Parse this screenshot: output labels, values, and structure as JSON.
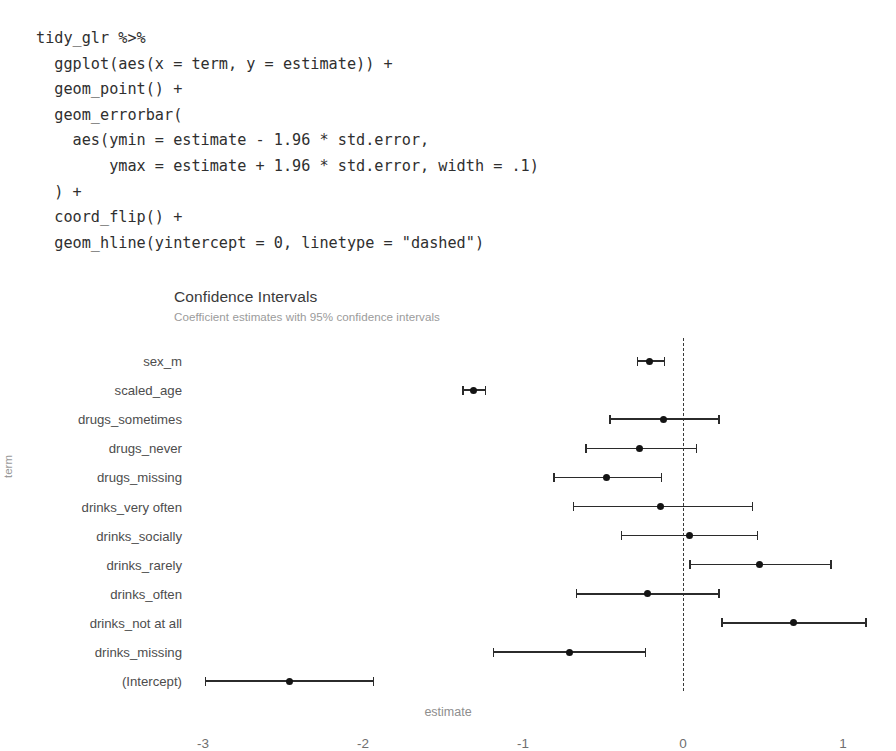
{
  "code": {
    "cut_glyph": "g",
    "lines": [
      "tidy_glr %>%",
      "  ggplot(aes(x = term, y = estimate)) +",
      "  geom_point() +",
      "  geom_errorbar(",
      "    aes(ymin = estimate - 1.96 * std.error,",
      "        ymax = estimate + 1.96 * std.error, width = .1)",
      "  ) +",
      "  coord_flip() +",
      "  geom_hline(yintercept = 0, linetype = \"dashed\")"
    ],
    "text": "tidy_glr %>%\n  ggplot(aes(x = term, y = estimate)) +\n  geom_point() +\n  geom_errorbar(\n    aes(ymin = estimate - 1.96 * std.error,\n        ymax = estimate + 1.96 * std.error, width = .1)\n  ) +\n  coord_flip() +\n  geom_hline(yintercept = 0, linetype = \"dashed\")"
  },
  "chart_data": {
    "type": "scatter",
    "title": "Confidence Intervals",
    "subtitle": "Coefficient estimates with 95% confidence intervals",
    "xlabel": "estimate",
    "ylabel": "term",
    "orientation": "horizontal",
    "grid": false,
    "legend": "none",
    "xlim": [
      -3.2,
      1.25
    ],
    "xticks": [
      -3,
      -2,
      -1,
      0,
      1
    ],
    "xtick_labels": [
      "-3",
      "-2",
      "-1",
      "0",
      "1"
    ],
    "reference_line": {
      "value": 0,
      "linetype": "dashed",
      "color": "#3a3a3a"
    },
    "categories": [
      "sex_m",
      "scaled_age",
      "drugs_sometimes",
      "drugs_never",
      "drugs_missing",
      "drinks_very often",
      "drinks_socially",
      "drinks_rarely",
      "drinks_often",
      "drinks_not at all",
      "drinks_missing",
      "(Intercept)"
    ],
    "estimates": [
      -0.21,
      -1.31,
      -0.12,
      -0.27,
      -0.48,
      -0.14,
      0.04,
      0.48,
      -0.22,
      0.69,
      -0.71,
      -2.46
    ],
    "conf_low": [
      -0.29,
      -1.38,
      -0.46,
      -0.61,
      -0.81,
      -0.69,
      -0.39,
      0.04,
      -0.67,
      0.24,
      -1.19,
      -2.99
    ],
    "conf_high": [
      -0.12,
      -1.24,
      0.22,
      0.08,
      -0.14,
      0.43,
      0.46,
      0.92,
      0.22,
      1.14,
      -0.24,
      -1.94
    ],
    "point_color": "#141414",
    "bar_color": "#2b2b2b"
  }
}
